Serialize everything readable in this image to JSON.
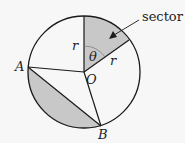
{
  "diagram": {
    "type": "circle-sector-segment",
    "background": "#f7f7f7",
    "fill_color": "#c8c8c8",
    "stroke_color": "#1a1a1a",
    "center": {
      "label": "O",
      "x": 84,
      "y": 72
    },
    "radius_px": 56,
    "points": {
      "A": {
        "label": "A",
        "x": 28,
        "y": 67
      },
      "B": {
        "label": "B",
        "x": 101,
        "y": 126
      }
    },
    "sector": {
      "callout_label": "sector",
      "angle_label": "θ",
      "radius_labels": [
        "r",
        "r"
      ]
    },
    "shaded_regions": [
      "sector",
      "segment AB"
    ]
  }
}
